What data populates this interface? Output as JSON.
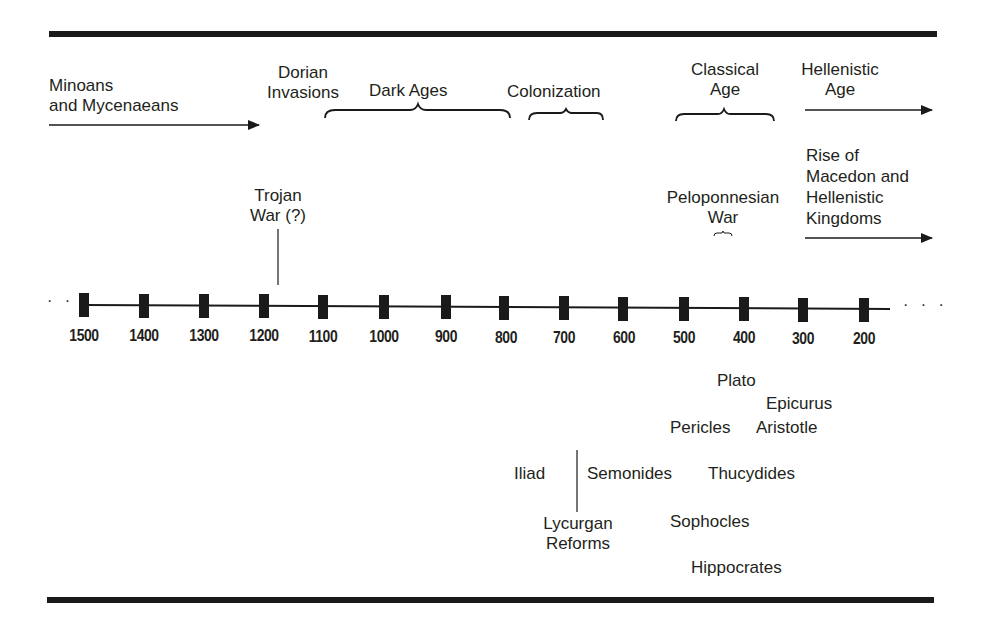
{
  "title_bar": {},
  "timeline": {
    "unit": "BCE",
    "ticks": [
      {
        "year": "1500",
        "x": 84
      },
      {
        "year": "1400",
        "x": 144
      },
      {
        "year": "1300",
        "x": 204
      },
      {
        "year": "1200",
        "x": 264
      },
      {
        "year": "1100",
        "x": 323
      },
      {
        "year": "1000",
        "x": 384
      },
      {
        "year": "900",
        "x": 446
      },
      {
        "year": "800",
        "x": 504
      },
      {
        "year": "700",
        "x": 564
      },
      {
        "year": "600",
        "x": 623
      },
      {
        "year": "500",
        "x": 684
      },
      {
        "year": "400",
        "x": 744
      },
      {
        "year": "300",
        "x": 803
      },
      {
        "year": "200",
        "x": 864
      }
    ],
    "left_ellipsis": "· · ·",
    "right_ellipsis": "· · ·"
  },
  "periods": {
    "minoans_line1": "Minoans",
    "minoans_line2": "and Mycenaeans",
    "dorian_line1": "Dorian",
    "dorian_line2": "Invasions",
    "dark_ages": "Dark Ages",
    "colonization": "Colonization",
    "classical_line1": "Classical",
    "classical_line2": "Age",
    "hellenistic_line1": "Hellenistic",
    "hellenistic_line2": "Age"
  },
  "events": {
    "trojan_line1": "Trojan",
    "trojan_line2": "War (?)",
    "pelop_line1": "Peloponnesian",
    "pelop_line2": "War",
    "macedon_line1": "Rise of",
    "macedon_line2": "Macedon and",
    "macedon_line3": "Hellenistic",
    "macedon_line4": "Kingdoms"
  },
  "people_works": {
    "plato": "Plato",
    "epicurus": "Epicurus",
    "pericles": "Pericles",
    "aristotle": "Aristotle",
    "iliad": "Iliad",
    "semonides": "Semonides",
    "thucydides": "Thucydides",
    "lycurgan_line1": "Lycurgan",
    "lycurgan_line2": "Reforms",
    "sophocles": "Sophocles",
    "hippocrates": "Hippocrates"
  }
}
